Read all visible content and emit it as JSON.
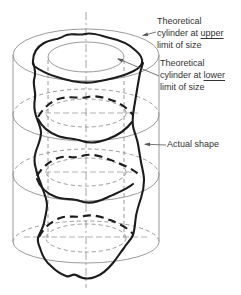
{
  "labels": {
    "upper": {
      "line1": "Theoretical",
      "line2_prefix": "cylinder at ",
      "line2_emphasis": "upper",
      "line3": "limit of size"
    },
    "lower": {
      "line1": "Theoretical",
      "line2_prefix": "cylinder at ",
      "line2_emphasis": "lower",
      "line3": "limit of size"
    },
    "actual": "Actual shape"
  },
  "icons": {
    "leader_arrowhead": "small filled triangle arrow"
  },
  "colors": {
    "background": "#ffffff",
    "line_thin": "#8f8f8f",
    "line_bold": "#1c1c1c",
    "leader_line": "#555555",
    "text_color": "#333333"
  }
}
